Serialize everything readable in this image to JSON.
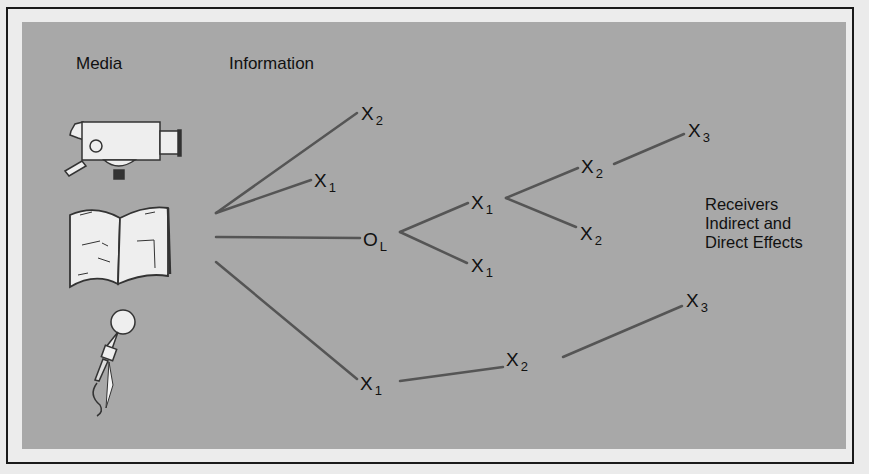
{
  "headers": {
    "media": "Media",
    "information": "Information",
    "receivers_line1": "Receivers",
    "receivers_line2": "Indirect and",
    "receivers_line3": "Direct Effects"
  },
  "media_icons": [
    "movie-camera",
    "open-book",
    "microphone"
  ],
  "nodes": [
    {
      "id": "n1",
      "base": "X",
      "sub": "2"
    },
    {
      "id": "n2",
      "base": "X",
      "sub": "1"
    },
    {
      "id": "n3",
      "base": "O",
      "sub": "L"
    },
    {
      "id": "n4",
      "base": "X",
      "sub": "1"
    },
    {
      "id": "n5",
      "base": "X",
      "sub": "1"
    },
    {
      "id": "n6",
      "base": "X",
      "sub": "2"
    },
    {
      "id": "n7",
      "base": "X",
      "sub": "2"
    },
    {
      "id": "n8",
      "base": "X",
      "sub": "3"
    },
    {
      "id": "n9",
      "base": "X",
      "sub": "1"
    },
    {
      "id": "n10",
      "base": "X",
      "sub": "2"
    },
    {
      "id": "n11",
      "base": "X",
      "sub": "3"
    }
  ],
  "colors": {
    "panel": "#a8a8a8",
    "frame_bg": "#ececec",
    "line": "#555555",
    "text": "#111111",
    "icon_fill": "#eeeeee"
  }
}
